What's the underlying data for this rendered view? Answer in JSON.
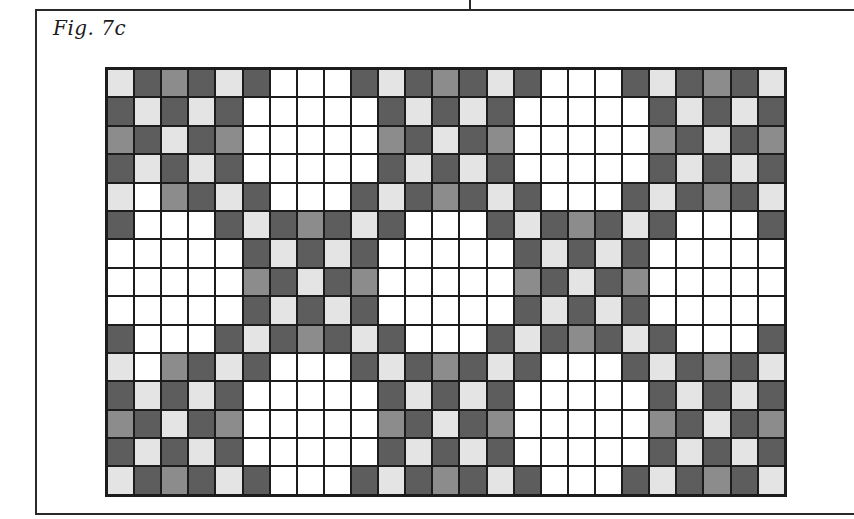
{
  "figure": {
    "label": "Fig. 7c"
  },
  "legend_colors": {
    "W": "#ffffff",
    "L": "#e4e4e4",
    "M": "#8c8c8c",
    "D": "#5d5d5d",
    "grid_line": "#1c1c1c"
  },
  "grid": {
    "columns": 25,
    "rows": 15,
    "cells": [
      "LDMDLDWWWDLDMDLDWWWDLDMDL",
      "DLDLDWWWWWDLDLDWWWWWDLDLD",
      "MDLDMWWWWWMDLDMWWWWWMDLDM",
      "DLDLDWWWWWDLDLDWWWWWDLDLD",
      "LWMDLDWWWDLDMDLDWWWDLDMDL",
      "DWWWDLDMDLDWWWDLDMDLDWWWD",
      "WWWWWDLDLDWWWWWDLDLDWWWWW",
      "WWWWWMDLDMWWWWWMDLDMWWWWW",
      "WWWWWDLDLDWWWWWDLDLDWWWWW",
      "DWWWDLDMDLDWWWDLDMDLDWWWD",
      "LWMDLDWWWDLDMDLDWWWDLDMDL",
      "DLDLDWWWWWDLDLDWWWWWDLDLD",
      "MDLDMWWWWWMDLDMWWWWWMDLDM",
      "DLDLDWWWWWDLDLDWWWWWDLDLD",
      "LDMDLDWWWDLDMDLDWWWDLDMDL"
    ]
  }
}
